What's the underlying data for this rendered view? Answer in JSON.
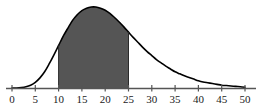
{
  "figure": {
    "name": "shaded-normal-distribution-curve",
    "background_color": "#ffffff",
    "curve_color": "#000000",
    "fill_color": "#555555",
    "axis_color": "#555555",
    "label_color": "#1a1a1a"
  },
  "chart_data": {
    "type": "area",
    "title": "",
    "subtitle": "",
    "xlabel": "",
    "ylabel": "",
    "grid": false,
    "legend": null,
    "xlim": [
      0,
      50
    ],
    "ylim": [
      0,
      1
    ],
    "xticks": [
      0,
      5,
      10,
      15,
      20,
      25,
      30,
      35,
      40,
      45,
      50
    ],
    "xtick_labels": [
      "0",
      "5",
      "10",
      "15",
      "20",
      "25",
      "30",
      "35",
      "40",
      "45",
      "50"
    ],
    "yticks": [],
    "ytick_labels": [],
    "distribution": {
      "shape": "right-skewed bell curve",
      "peak_x": 18,
      "peak_y": 1.0
    },
    "shaded_region": {
      "from": 10,
      "to": 25,
      "color": "#555555",
      "label": ""
    },
    "series": [
      {
        "name": "density",
        "x": [
          0,
          1,
          2,
          3,
          4,
          5,
          6,
          7,
          8,
          9,
          10,
          11,
          12,
          13,
          14,
          15,
          16,
          17,
          18,
          19,
          20,
          21,
          22,
          23,
          24,
          25,
          26,
          27,
          28,
          29,
          30,
          31,
          32,
          33,
          34,
          35,
          36,
          37,
          38,
          39,
          40,
          41,
          42,
          43,
          44,
          45,
          46,
          47,
          48,
          49,
          50
        ],
        "y": [
          0.0,
          0.0,
          0.005,
          0.015,
          0.035,
          0.07,
          0.125,
          0.2,
          0.3,
          0.41,
          0.525,
          0.64,
          0.74,
          0.835,
          0.905,
          0.955,
          0.985,
          1.0,
          1.0,
          0.985,
          0.96,
          0.92,
          0.87,
          0.815,
          0.755,
          0.69,
          0.625,
          0.565,
          0.505,
          0.45,
          0.4,
          0.35,
          0.31,
          0.27,
          0.235,
          0.2,
          0.175,
          0.15,
          0.13,
          0.11,
          0.09,
          0.075,
          0.065,
          0.055,
          0.045,
          0.035,
          0.03,
          0.025,
          0.02,
          0.015,
          0.01
        ]
      }
    ]
  }
}
